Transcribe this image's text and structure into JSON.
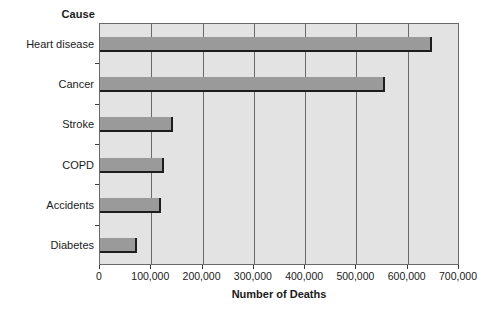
{
  "chart_data": {
    "type": "bar",
    "orientation": "horizontal",
    "title": "",
    "xlabel": "Number of Deaths",
    "ylabel": "Cause",
    "categories": [
      "Heart disease",
      "Cancer",
      "Stroke",
      "COPD",
      "Accidents",
      "Diabetes"
    ],
    "values": [
      648000,
      555000,
      142000,
      125000,
      118000,
      72000
    ],
    "xlim": [
      0,
      700000
    ],
    "xticks": [
      0,
      100000,
      200000,
      300000,
      400000,
      500000,
      600000,
      700000
    ],
    "xtick_labels": [
      "0",
      "100,000",
      "200,000",
      "300,000",
      "400,000",
      "500,000",
      "600,000",
      "700,000"
    ],
    "grid": "vertical",
    "legend": "none",
    "bar_color": "#9a9a9a",
    "bar_edge_color": "#1d1d1d",
    "plot_background": "#e3e3e3",
    "frame_color": "#6a6a6a",
    "page_background": "#ffffff"
  }
}
